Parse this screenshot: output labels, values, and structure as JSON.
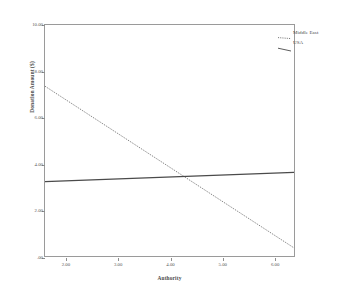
{
  "chart_data": {
    "type": "line",
    "title": "",
    "xlabel": "Authority",
    "ylabel": "Donation Amount ($)",
    "xlim": [
      1.6,
      6.4
    ],
    "ylim": [
      0.0,
      10.0
    ],
    "x_ticks": [
      "2.00",
      "3.00",
      "4.00",
      "5.00",
      "6.00"
    ],
    "x_tick_values": [
      2.0,
      3.0,
      4.0,
      5.0,
      6.0
    ],
    "y_ticks": [
      "10.00",
      "8.00",
      "6.00",
      "4.00",
      "2.00",
      ".00"
    ],
    "y_tick_values": [
      10.0,
      8.0,
      6.0,
      4.0,
      2.0,
      0.0
    ],
    "grid": false,
    "legend_position": "top-right",
    "series": [
      {
        "name": "Middle East",
        "style": "dotted",
        "color": "#6a6a6a",
        "x": [
          1.6,
          6.4
        ],
        "values": [
          7.35,
          0.35
        ]
      },
      {
        "name": "USA",
        "style": "solid",
        "color": "#4a4a4a",
        "x": [
          1.6,
          6.4
        ],
        "values": [
          3.22,
          3.62
        ]
      }
    ],
    "legend": [
      "Middle East",
      "USA"
    ]
  },
  "axes": {
    "y_title": "Donation Amount ($)",
    "x_title": "Authority"
  },
  "colors": {
    "frame": "#9a9a9a",
    "text": "#4a4a4a",
    "series_middle_east": "#6a6a6a",
    "series_usa": "#4a4a4a",
    "background": "#ffffff"
  }
}
